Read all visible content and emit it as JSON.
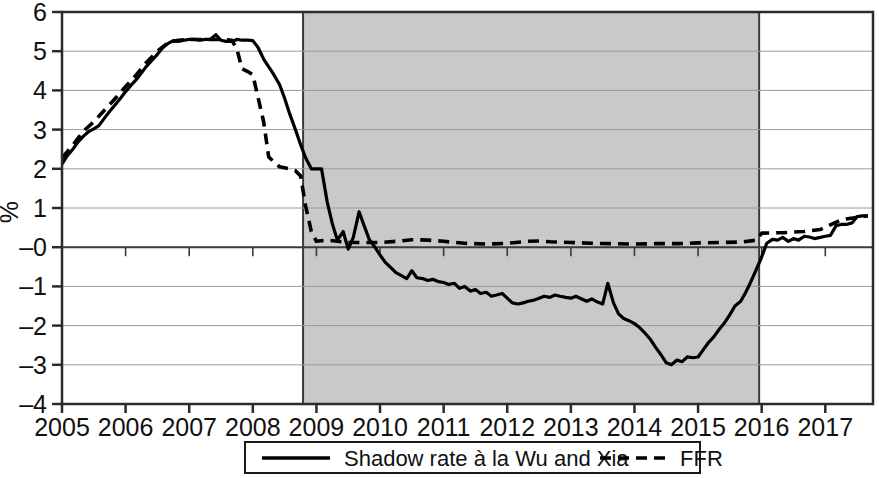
{
  "chart_data": {
    "type": "line",
    "title": "",
    "subtitle": "",
    "xlabel": "",
    "ylabel": "%",
    "xlim": [
      2005.0,
      2017.75
    ],
    "ylim": [
      -4,
      6
    ],
    "yticks": [
      6,
      5,
      4,
      3,
      2,
      1,
      0,
      -1,
      -2,
      -3,
      -4
    ],
    "ytick_labels": [
      "6",
      "5",
      "4",
      "3",
      "2",
      "1",
      "–0",
      "–1",
      "–2",
      "–3",
      "–4"
    ],
    "xticks": [
      2005,
      2006,
      2007,
      2008,
      2009,
      2010,
      2011,
      2012,
      2013,
      2014,
      2015,
      2016,
      2017
    ],
    "xtick_labels": [
      "2005",
      "2006",
      "2007",
      "2008",
      "2009",
      "2010",
      "2011",
      "2012",
      "2013",
      "2014",
      "2015",
      "2016",
      "2017"
    ],
    "grid": "horizontal",
    "legend_position": "bottom-outside",
    "zero_line": 0,
    "shaded_regions": [
      {
        "name": "zero-lower-bound-period",
        "x_start": 2008.79,
        "x_end": 2015.96,
        "color": "#c9c9c9"
      }
    ],
    "series": [
      {
        "name": "Shadow rate à la Wu and Xia",
        "style": "solid",
        "color": "#000000",
        "x": [
          2005.0,
          2005.08,
          2005.17,
          2005.25,
          2005.33,
          2005.42,
          2005.5,
          2005.58,
          2005.67,
          2005.75,
          2005.83,
          2005.92,
          2006.0,
          2006.08,
          2006.17,
          2006.25,
          2006.33,
          2006.42,
          2006.5,
          2006.58,
          2006.67,
          2006.75,
          2006.83,
          2006.92,
          2007.0,
          2007.08,
          2007.17,
          2007.25,
          2007.33,
          2007.42,
          2007.5,
          2007.58,
          2007.67,
          2007.75,
          2007.83,
          2007.92,
          2008.0,
          2008.08,
          2008.17,
          2008.25,
          2008.33,
          2008.42,
          2008.5,
          2008.58,
          2008.67,
          2008.75,
          2008.83,
          2008.92,
          2009.0,
          2009.08,
          2009.17,
          2009.25,
          2009.33,
          2009.42,
          2009.5,
          2009.58,
          2009.67,
          2009.75,
          2009.83,
          2009.92,
          2010.0,
          2010.08,
          2010.17,
          2010.25,
          2010.33,
          2010.42,
          2010.5,
          2010.58,
          2010.67,
          2010.75,
          2010.83,
          2010.92,
          2011.0,
          2011.08,
          2011.17,
          2011.25,
          2011.33,
          2011.42,
          2011.5,
          2011.58,
          2011.67,
          2011.75,
          2011.83,
          2011.92,
          2012.0,
          2012.08,
          2012.17,
          2012.25,
          2012.33,
          2012.42,
          2012.5,
          2012.58,
          2012.67,
          2012.75,
          2012.83,
          2012.92,
          2013.0,
          2013.08,
          2013.17,
          2013.25,
          2013.33,
          2013.42,
          2013.5,
          2013.58,
          2013.67,
          2013.75,
          2013.83,
          2013.92,
          2014.0,
          2014.08,
          2014.17,
          2014.25,
          2014.33,
          2014.42,
          2014.5,
          2014.58,
          2014.67,
          2014.75,
          2014.83,
          2014.92,
          2015.0,
          2015.08,
          2015.17,
          2015.25,
          2015.33,
          2015.42,
          2015.5,
          2015.58,
          2015.67,
          2015.75,
          2015.83,
          2015.92,
          2016.0,
          2016.08,
          2016.17,
          2016.25,
          2016.33,
          2016.42,
          2016.5,
          2016.58,
          2016.67,
          2016.75,
          2016.83,
          2016.92,
          2017.0,
          2017.08,
          2017.17,
          2017.25,
          2017.33,
          2017.42,
          2017.5,
          2017.58,
          2017.67
        ],
        "y": [
          2.12,
          2.33,
          2.5,
          2.68,
          2.82,
          2.95,
          3.02,
          3.1,
          3.3,
          3.47,
          3.62,
          3.8,
          3.97,
          4.12,
          4.28,
          4.45,
          4.62,
          4.78,
          4.92,
          5.08,
          5.2,
          5.27,
          5.25,
          5.28,
          5.3,
          5.3,
          5.28,
          5.3,
          5.3,
          5.42,
          5.28,
          5.25,
          5.25,
          5.3,
          5.28,
          5.28,
          5.27,
          5.1,
          4.8,
          4.6,
          4.4,
          4.15,
          3.8,
          3.4,
          3.0,
          2.62,
          2.28,
          2.0,
          2.0,
          2.0,
          1.15,
          0.6,
          0.18,
          0.4,
          -0.05,
          0.25,
          0.9,
          0.55,
          0.2,
          0.0,
          -0.2,
          -0.38,
          -0.52,
          -0.65,
          -0.72,
          -0.8,
          -0.6,
          -0.78,
          -0.8,
          -0.85,
          -0.82,
          -0.88,
          -0.9,
          -0.95,
          -0.92,
          -1.05,
          -1.0,
          -1.12,
          -1.08,
          -1.18,
          -1.15,
          -1.25,
          -1.22,
          -1.18,
          -1.3,
          -1.42,
          -1.45,
          -1.42,
          -1.38,
          -1.35,
          -1.3,
          -1.25,
          -1.28,
          -1.22,
          -1.25,
          -1.28,
          -1.3,
          -1.25,
          -1.32,
          -1.38,
          -1.32,
          -1.4,
          -1.45,
          -0.92,
          -1.42,
          -1.7,
          -1.82,
          -1.88,
          -1.95,
          -2.05,
          -2.2,
          -2.35,
          -2.55,
          -2.75,
          -2.95,
          -3.0,
          -2.88,
          -2.92,
          -2.8,
          -2.82,
          -2.8,
          -2.62,
          -2.42,
          -2.28,
          -2.1,
          -1.92,
          -1.72,
          -1.5,
          -1.38,
          -1.15,
          -0.88,
          -0.55,
          -0.25,
          0.1,
          0.2,
          0.18,
          0.25,
          0.15,
          0.22,
          0.18,
          0.28,
          0.26,
          0.22,
          0.25,
          0.28,
          0.3,
          0.55,
          0.58,
          0.58,
          0.62,
          0.78,
          0.8,
          0.8
        ]
      },
      {
        "name": "FFR",
        "style": "dashed",
        "color": "#000000",
        "x": [
          2005.0,
          2005.17,
          2005.33,
          2005.5,
          2005.67,
          2005.83,
          2006.0,
          2006.17,
          2006.33,
          2006.5,
          2006.67,
          2006.83,
          2007.0,
          2007.17,
          2007.33,
          2007.5,
          2007.67,
          2007.75,
          2007.83,
          2007.92,
          2008.0,
          2008.17,
          2008.25,
          2008.42,
          2008.58,
          2008.67,
          2008.75,
          2008.83,
          2008.92,
          2009.0,
          2009.17,
          2009.33,
          2009.5,
          2009.67,
          2009.83,
          2010.0,
          2010.25,
          2010.5,
          2010.58,
          2010.75,
          2011.0,
          2011.33,
          2011.67,
          2012.0,
          2012.33,
          2012.5,
          2012.67,
          2013.0,
          2013.33,
          2013.67,
          2014.0,
          2014.33,
          2014.67,
          2015.0,
          2015.33,
          2015.67,
          2015.92,
          2016.0,
          2016.33,
          2016.67,
          2016.92,
          2017.25,
          2017.67
        ],
        "y": [
          2.28,
          2.6,
          2.95,
          3.2,
          3.5,
          3.78,
          4.1,
          4.4,
          4.72,
          5.0,
          5.22,
          5.28,
          5.3,
          5.3,
          5.3,
          5.3,
          5.28,
          5.05,
          4.55,
          4.48,
          4.4,
          3.2,
          2.3,
          2.05,
          2.0,
          1.95,
          1.82,
          1.05,
          0.4,
          0.15,
          0.18,
          0.15,
          0.12,
          0.12,
          0.12,
          0.12,
          0.15,
          0.19,
          0.19,
          0.18,
          0.15,
          0.1,
          0.08,
          0.1,
          0.15,
          0.16,
          0.14,
          0.12,
          0.1,
          0.09,
          0.08,
          0.09,
          0.09,
          0.11,
          0.12,
          0.13,
          0.18,
          0.36,
          0.37,
          0.4,
          0.45,
          0.7,
          0.8
        ]
      }
    ],
    "legend": [
      {
        "label": "Shadow rate à la Wu and Xia",
        "style": "solid"
      },
      {
        "label": "FFR",
        "style": "dashed"
      }
    ]
  },
  "axes": {
    "y_axis_title": "%"
  }
}
